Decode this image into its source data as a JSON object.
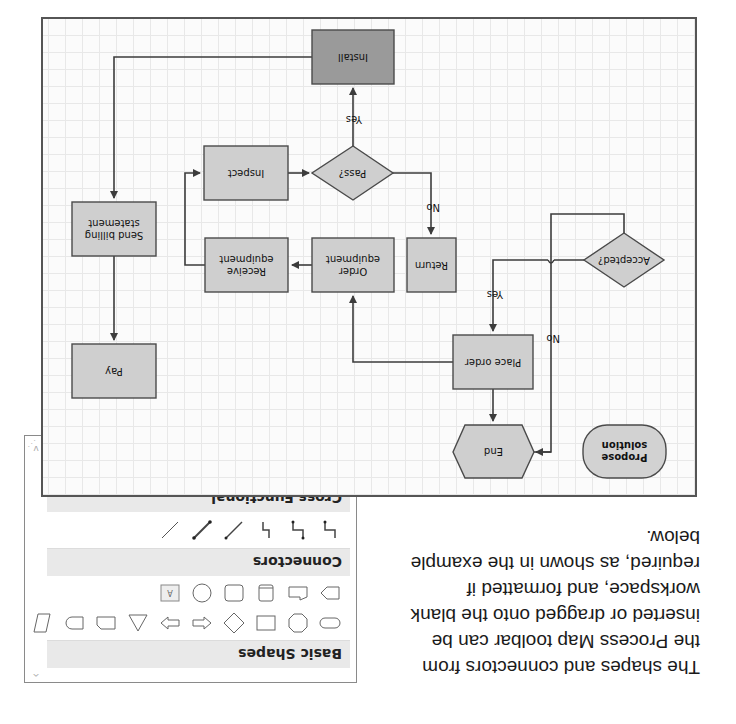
{
  "intro": {
    "text": "The shapes and connectors from the Process Map toolbar can be inserted or dragged onto the blank workspace, and formatted if required, as shown in the example below."
  },
  "palette": {
    "sections": [
      {
        "label": "Basic Shapes",
        "icons": [
          "rounded-rectangle-icon",
          "octagon-icon",
          "rectangle-icon",
          "diamond-icon",
          "left-arrow-icon",
          "right-arrow-icon",
          "triangle-icon",
          "snipped-rectangle-icon",
          "delay-icon",
          "parallelogram-icon",
          "pentagon-icon",
          "trapezoid-document-icon",
          "cylinder-icon",
          "square-icon",
          "circle-icon",
          "text-box-icon"
        ]
      },
      {
        "label": "Connectors",
        "icons": [
          "elbow-connector-icon",
          "elbow-arrow-connector-icon",
          "elbow-line-icon",
          "arrow-line-icon",
          "double-arrow-line-icon",
          "straight-line-icon"
        ]
      },
      {
        "label": "Cross Functional",
        "icons": [
          "swimlane-horizontal-icon",
          "swimlane-vertical-icon"
        ]
      }
    ],
    "scroll_up": "^",
    "scroll_down": "v"
  },
  "diagram": {
    "colors": {
      "fill": "#cfcfcf",
      "install_fill": "#9a9a9a",
      "stroke": "#4a4a4a",
      "line": "#3c3c3c"
    },
    "nodes": {
      "propose": "Propose solution",
      "accepted": "Accepted?",
      "end": "End",
      "place_order": "Place order",
      "return": "Return",
      "order_equipment": "Order equipment",
      "receive_equipment": "Receive equipment",
      "inspect": "Inspect",
      "pass": "Pass?",
      "install": "Install",
      "send_billing": "Send billing statement",
      "pay": "Pay"
    },
    "edge_labels": {
      "accepted_yes": "Yes",
      "accepted_no": "No",
      "pass_yes": "Yes",
      "pass_no": "No"
    }
  }
}
